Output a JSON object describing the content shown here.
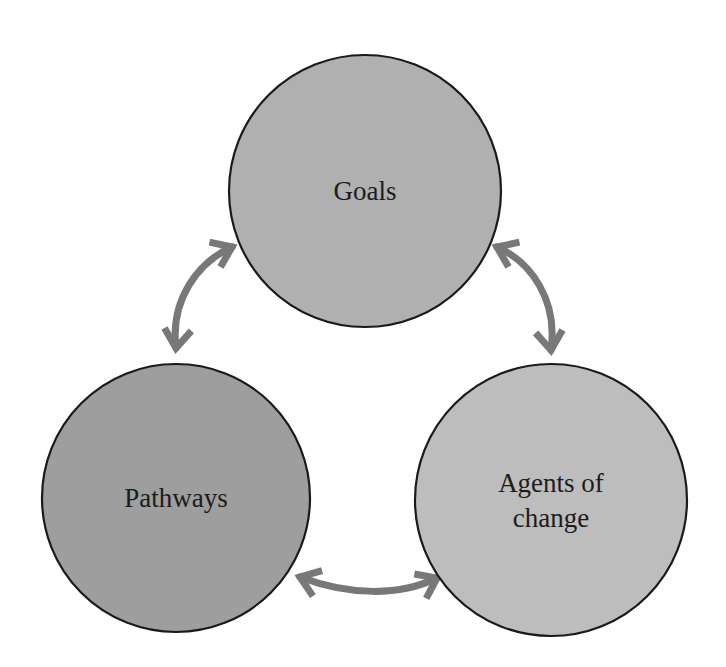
{
  "diagram": {
    "type": "cycle-diagram",
    "background_color": "#ffffff",
    "node_outline_color": "#1a1a1a",
    "node_outline_width": 2.2,
    "label_color": "#1c1c1c",
    "arrow_color": "#787878",
    "arrow_width": 7,
    "nodes": [
      {
        "id": "goals",
        "label": "Goals",
        "lines": [
          "Goals"
        ],
        "cx": 365,
        "cy": 191,
        "r": 136,
        "fill": "#b0b0b0",
        "font_size": 27
      },
      {
        "id": "pathways",
        "label": "Pathways",
        "lines": [
          "Pathways"
        ],
        "cx": 176,
        "cy": 498,
        "r": 134,
        "fill": "#9e9e9e",
        "font_size": 27
      },
      {
        "id": "agents-of-change",
        "label": "Agents of change",
        "lines": [
          "Agents of",
          "change"
        ],
        "cx": 551,
        "cy": 500,
        "r": 136,
        "fill": "#bdbdbd",
        "font_size": 27
      }
    ],
    "connectors": [
      {
        "id": "pathways-goals",
        "from": "pathways",
        "to": "goals",
        "bidirectional": true,
        "path": "M 176 348 C 170 300 198 262 232 247",
        "head_start": {
          "x": 176,
          "y": 348,
          "angle": 96
        },
        "head_end": {
          "x": 232,
          "y": 247,
          "angle": -24
        }
      },
      {
        "id": "goals-agents",
        "from": "goals",
        "to": "agents-of-change",
        "bidirectional": true,
        "path": "M 497 247 C 531 262 558 300 551 350",
        "head_start": {
          "x": 497,
          "y": 247,
          "angle": 204
        },
        "head_end": {
          "x": 551,
          "y": 350,
          "angle": 84
        }
      },
      {
        "id": "pathways-agents",
        "from": "pathways",
        "to": "agents-of-change",
        "bidirectional": true,
        "path": "M 300 577 C 350 596 400 596 437 578",
        "head_start": {
          "x": 300,
          "y": 577,
          "angle": 200
        },
        "head_end": {
          "x": 437,
          "y": 578,
          "angle": -26
        }
      }
    ]
  }
}
